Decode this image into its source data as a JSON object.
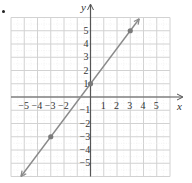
{
  "chart_data": {
    "type": "line",
    "title": "",
    "xlabel": "x",
    "ylabel": "y",
    "xlim": [
      -6,
      6
    ],
    "ylim": [
      -6,
      6
    ],
    "grid": true,
    "x_ticks": [
      "-5",
      "-4",
      "-3",
      "-2",
      "1",
      "2",
      "3",
      "4",
      "5"
    ],
    "y_ticks": [
      "5",
      "4",
      "3",
      "2",
      "1",
      "-1",
      "-2",
      "-3",
      "-4",
      "-5"
    ],
    "series": [
      {
        "name": "line",
        "equation": "y = (4/3)x + 1",
        "points": [
          {
            "x": -3,
            "y": -3
          },
          {
            "x": 0,
            "y": 1
          },
          {
            "x": 3,
            "y": 5
          }
        ],
        "arrows_both_ends": true
      }
    ],
    "colors": {
      "line": "#8a8a8a",
      "point": "#7a7a7a",
      "grid": "#d9d9d9",
      "axis": "#555555"
    }
  }
}
